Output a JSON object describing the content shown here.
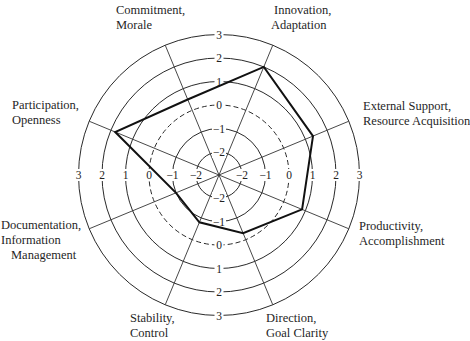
{
  "chart_data": {
    "type": "radar",
    "title": "",
    "scale": {
      "min": -2,
      "max": 3,
      "ticks": [
        -2,
        -1,
        0,
        1,
        2,
        3
      ],
      "zero_ring_style": "dashed"
    },
    "axes": [
      {
        "id": "external",
        "label_lines": [
          "External Support,",
          "Resource Acquisition"
        ],
        "angle": -22.5
      },
      {
        "id": "innovation",
        "label_lines": [
          "Innovation,",
          "Adaptation"
        ],
        "angle": -67.5
      },
      {
        "id": "commitment",
        "label_lines": [
          "Commitment,",
          "Morale"
        ],
        "angle": -112.5
      },
      {
        "id": "participation",
        "label_lines": [
          "Participation,",
          "Openness"
        ],
        "angle": -157.5
      },
      {
        "id": "documentation",
        "label_lines": [
          "Documentation,",
          "Information",
          "Management"
        ],
        "angle": 157.5
      },
      {
        "id": "stability",
        "label_lines": [
          "Stability,",
          "Control"
        ],
        "angle": 112.5
      },
      {
        "id": "direction",
        "label_lines": [
          "Direction,",
          "Goal Clarity"
        ],
        "angle": 67.5
      },
      {
        "id": "productivity",
        "label_lines": [
          "Productivity,",
          "Accomplishment"
        ],
        "angle": 22.5
      }
    ],
    "series": [
      {
        "name": "Profile",
        "values": {
          "external": 1.35,
          "innovation": 2.0,
          "commitment": 0.5,
          "participation": 1.8,
          "documentation": -1.0,
          "stability": -0.8,
          "direction": -0.3,
          "productivity": 0.85
        }
      }
    ],
    "grid": true,
    "legend": null
  },
  "labels": {
    "commitment": [
      "Commitment,",
      "Morale"
    ],
    "innovation": [
      "Innovation,",
      "Adaptation"
    ],
    "external": [
      "External Support,",
      "Resource Acquisition"
    ],
    "participation": [
      "Participation,",
      "Openness"
    ],
    "productivity": [
      "Productivity,",
      "Accomplishment"
    ],
    "documentation": [
      "Documentation,",
      "Information",
      "Management"
    ],
    "stability": [
      "Stability,",
      "Control"
    ],
    "direction": [
      "Direction,",
      "Goal Clarity"
    ]
  },
  "tick_labels": {
    "vertical": [
      "3",
      "2",
      "1",
      "0",
      "−1",
      "−2"
    ],
    "horizontal_left": [
      "3",
      "2",
      "1",
      "0",
      "−1",
      "−2"
    ],
    "horizontal_right": [
      "−2",
      "−1",
      "0",
      "1",
      "2",
      "3"
    ]
  }
}
